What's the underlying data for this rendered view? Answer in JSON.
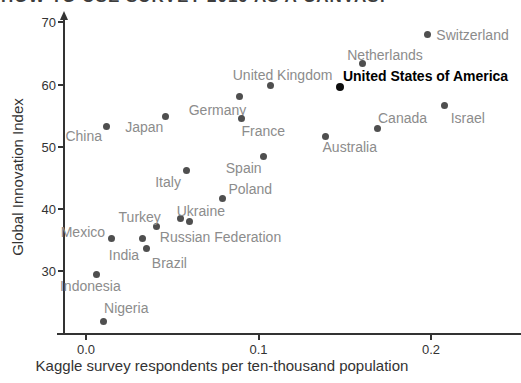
{
  "title": {
    "text": "HOW TO USE SURVEY 2019 AS A CANVAS!"
  },
  "colors": {
    "axis": "#333333",
    "dot_gray": "#4f4f4f",
    "label_gray": "#8c8c8c",
    "highlight": "#000000",
    "background": "#ffffff"
  },
  "chart_data": {
    "type": "scatter",
    "xlabel": "Kaggle survey respondents per ten-thousand population",
    "ylabel": "Global Innovation Index",
    "xlim": [
      -0.016,
      0.252
    ],
    "ylim": [
      19.5,
      71.5
    ],
    "grid": false,
    "legend": false,
    "x_ticks": [
      {
        "label": "0.0",
        "value": 0.0
      },
      {
        "label": "0.1",
        "value": 0.1
      },
      {
        "label": "0.2",
        "value": 0.2
      }
    ],
    "y_ticks": [
      {
        "label": "30",
        "value": 30
      },
      {
        "label": "40",
        "value": 40
      },
      {
        "label": "50",
        "value": 50
      },
      {
        "label": "60",
        "value": 60
      },
      {
        "label": "70",
        "value": 70
      }
    ],
    "points": [
      {
        "name": "Switzerland",
        "x": 0.198,
        "y": 68.0,
        "dx": 45,
        "dy": 0,
        "highlight": false
      },
      {
        "name": "Netherlands",
        "x": 0.16,
        "y": 63.3,
        "dx": 23,
        "dy": -9,
        "highlight": false
      },
      {
        "name": "United States of America",
        "x": 0.147,
        "y": 59.6,
        "dx": 86,
        "dy": -11,
        "highlight": true
      },
      {
        "name": "United Kingdom",
        "x": 0.107,
        "y": 59.9,
        "dx": 12,
        "dy": -10,
        "highlight": false
      },
      {
        "name": "Germany",
        "x": 0.089,
        "y": 58.0,
        "dx": -22,
        "dy": 13,
        "highlight": false
      },
      {
        "name": "Israel",
        "x": 0.208,
        "y": 56.7,
        "dx": 23,
        "dy": 13,
        "highlight": false
      },
      {
        "name": "Japan",
        "x": 0.046,
        "y": 54.9,
        "dx": -21,
        "dy": 11,
        "highlight": false
      },
      {
        "name": "France",
        "x": 0.09,
        "y": 54.5,
        "dx": 22,
        "dy": 12,
        "highlight": false
      },
      {
        "name": "China",
        "x": 0.012,
        "y": 53.2,
        "dx": -23,
        "dy": 9,
        "highlight": false
      },
      {
        "name": "Canada",
        "x": 0.169,
        "y": 53.0,
        "dx": 25,
        "dy": -10,
        "highlight": false
      },
      {
        "name": "Australia",
        "x": 0.139,
        "y": 51.7,
        "dx": 24,
        "dy": 11,
        "highlight": false
      },
      {
        "name": "Spain",
        "x": 0.103,
        "y": 48.5,
        "dx": -20,
        "dy": 12,
        "highlight": false
      },
      {
        "name": "Italy",
        "x": 0.058,
        "y": 46.1,
        "dx": -18,
        "dy": 11,
        "highlight": false
      },
      {
        "name": "Poland",
        "x": 0.079,
        "y": 41.6,
        "dx": 28,
        "dy": -10,
        "highlight": false
      },
      {
        "name": "Ukraine",
        "x": 0.055,
        "y": 38.4,
        "dx": 20,
        "dy": -8,
        "highlight": false
      },
      {
        "name": "Russian Federation",
        "x": 0.06,
        "y": 37.9,
        "dx": 31,
        "dy": 15,
        "highlight": false
      },
      {
        "name": "Turkey",
        "x": 0.041,
        "y": 37.1,
        "dx": -17,
        "dy": -10,
        "highlight": false
      },
      {
        "name": "Mexico",
        "x": 0.015,
        "y": 35.2,
        "dx": -29,
        "dy": -7,
        "highlight": false
      },
      {
        "name": "India",
        "x": 0.033,
        "y": 35.2,
        "dx": -19,
        "dy": 16,
        "highlight": false
      },
      {
        "name": "Brazil",
        "x": 0.035,
        "y": 33.6,
        "dx": 23,
        "dy": 14,
        "highlight": false
      },
      {
        "name": "Indonesia",
        "x": 0.006,
        "y": 29.5,
        "dx": -6,
        "dy": 12,
        "highlight": false
      },
      {
        "name": "Nigeria",
        "x": 0.01,
        "y": 21.9,
        "dx": 23,
        "dy": -13,
        "highlight": false
      }
    ]
  }
}
